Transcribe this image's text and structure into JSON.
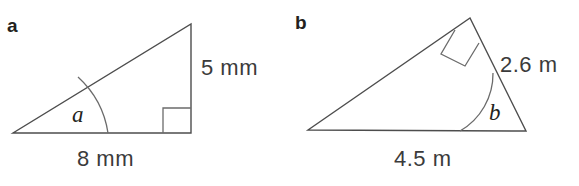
{
  "figure": {
    "background_color": "#ffffff",
    "stroke_color": "#4d4d4d",
    "text_color": "#3b3b3b",
    "label_color": "#231f20",
    "width": 579,
    "height": 186
  },
  "panels": [
    {
      "letter": "a",
      "shape": "right-triangle",
      "angle_label": "a",
      "right_angle_position": "bottom-right",
      "dimensions": [
        {
          "name": "vertical-side",
          "value": "5 mm"
        },
        {
          "name": "horizontal-side",
          "value": "8 mm"
        }
      ]
    },
    {
      "letter": "b",
      "shape": "right-triangle",
      "angle_label": "b",
      "right_angle_position": "apex",
      "dimensions": [
        {
          "name": "slant-side",
          "value": "2.6 m"
        },
        {
          "name": "horizontal-side",
          "value": "4.5 m"
        }
      ]
    }
  ]
}
